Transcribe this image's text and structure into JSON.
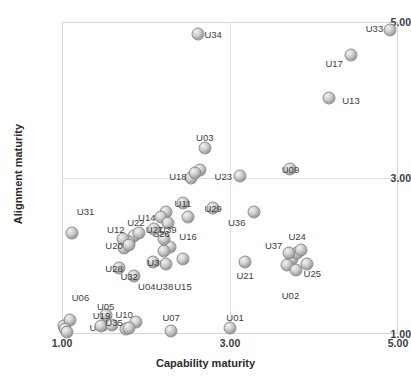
{
  "chart_data": {
    "type": "scatter",
    "title": "",
    "xlabel": "Capability maturity",
    "ylabel": "Alignment maturity",
    "xlim": [
      1.0,
      5.0
    ],
    "ylim": [
      1.0,
      5.0
    ],
    "xticks": [
      "1.00",
      "3.00",
      "5.00"
    ],
    "xtick_values": [
      1.0,
      3.0,
      5.0
    ],
    "yticks": [
      "1.00",
      "3.00",
      "5.00"
    ],
    "ytick_values": [
      1.0,
      3.0,
      5.0
    ],
    "grid": true,
    "legend": "none",
    "marker_style": "3d-gray-sphere",
    "points": [
      {
        "label": "U01",
        "x": 3.0,
        "y": 1.08,
        "lx": 3.06,
        "ly": 1.22
      },
      {
        "label": "U02",
        "x": 3.78,
        "y": 1.82,
        "lx": 3.72,
        "ly": 1.5
      },
      {
        "label": "U03",
        "x": 2.7,
        "y": 3.38,
        "lx": 2.7,
        "ly": 3.52
      },
      {
        "label": "U04",
        "x": 2.08,
        "y": 1.92,
        "lx": 2.01,
        "ly": 1.62
      },
      {
        "label": "U05",
        "x": 1.52,
        "y": 1.24,
        "lx": 1.52,
        "ly": 1.36
      },
      {
        "label": "U06",
        "x": 1.03,
        "y": 1.06,
        "lx": 1.22,
        "ly": 1.48
      },
      {
        "label": "U07",
        "x": 2.3,
        "y": 1.04,
        "lx": 2.3,
        "ly": 1.22
      },
      {
        "label": "U08",
        "x": 1.06,
        "y": 1.02,
        "lx": 1.43,
        "ly": 1.09
      },
      {
        "label": "U09",
        "x": 3.72,
        "y": 3.12,
        "lx": 3.72,
        "ly": 3.12
      },
      {
        "label": "U10",
        "x": 1.8,
        "y": 1.08,
        "lx": 1.74,
        "ly": 1.26
      },
      {
        "label": "U11",
        "x": 2.44,
        "y": 2.68,
        "lx": 2.44,
        "ly": 2.68
      },
      {
        "label": "U12",
        "x": 1.73,
        "y": 2.22,
        "lx": 1.64,
        "ly": 2.34
      },
      {
        "label": "U13",
        "x": 4.18,
        "y": 4.02,
        "lx": 4.44,
        "ly": 4.0
      },
      {
        "label": "U14",
        "x": 2.18,
        "y": 2.5,
        "lx": 2.01,
        "ly": 2.5
      },
      {
        "label": "U15",
        "x": 2.44,
        "y": 1.96,
        "lx": 2.44,
        "ly": 1.62
      },
      {
        "label": "U16",
        "x": 2.5,
        "y": 2.5,
        "lx": 2.5,
        "ly": 2.26
      },
      {
        "label": "U17",
        "x": 4.44,
        "y": 4.58,
        "lx": 4.24,
        "ly": 4.48
      },
      {
        "label": "U18",
        "x": 2.58,
        "y": 3.06,
        "lx": 2.38,
        "ly": 3.02
      },
      {
        "label": "U19",
        "x": 1.47,
        "y": 1.1,
        "lx": 1.47,
        "ly": 1.24
      },
      {
        "label": "U20",
        "x": 1.8,
        "y": 2.14,
        "lx": 1.62,
        "ly": 2.14
      },
      {
        "label": "U21",
        "x": 3.18,
        "y": 1.92,
        "lx": 3.18,
        "ly": 1.76
      },
      {
        "label": "U22",
        "x": 1.92,
        "y": 2.3,
        "lx": 1.88,
        "ly": 2.44
      },
      {
        "label": "U23",
        "x": 3.12,
        "y": 3.02,
        "lx": 2.92,
        "ly": 3.02
      },
      {
        "label": "U24",
        "x": 3.84,
        "y": 2.08,
        "lx": 3.8,
        "ly": 2.26
      },
      {
        "label": "U25",
        "x": 3.92,
        "y": 1.9,
        "lx": 3.98,
        "ly": 1.78
      },
      {
        "label": "U26",
        "x": 2.22,
        "y": 2.22,
        "lx": 2.18,
        "ly": 2.3
      },
      {
        "label": "U27",
        "x": 2.1,
        "y": 2.34,
        "lx": 2.1,
        "ly": 2.34
      },
      {
        "label": "U28",
        "x": 1.68,
        "y": 1.84,
        "lx": 1.62,
        "ly": 1.84
      },
      {
        "label": "U29",
        "x": 2.8,
        "y": 2.62,
        "lx": 2.8,
        "ly": 2.62
      },
      {
        "label": "U30",
        "x": 2.22,
        "y": 2.06,
        "lx": 2.12,
        "ly": 1.92
      },
      {
        "label": "U31",
        "x": 1.12,
        "y": 2.3,
        "lx": 1.28,
        "ly": 2.58
      },
      {
        "label": "U32",
        "x": 1.86,
        "y": 1.74,
        "lx": 1.8,
        "ly": 1.74
      },
      {
        "label": "U33",
        "x": 4.9,
        "y": 4.9,
        "lx": 4.72,
        "ly": 4.92
      },
      {
        "label": "U34",
        "x": 2.62,
        "y": 4.84,
        "lx": 2.8,
        "ly": 4.84
      },
      {
        "label": "U35",
        "x": 1.6,
        "y": 1.12,
        "lx": 1.62,
        "ly": 1.16
      },
      {
        "label": "U36",
        "x": 3.28,
        "y": 2.56,
        "lx": 3.08,
        "ly": 2.44
      },
      {
        "label": "U37",
        "x": 3.7,
        "y": 2.04,
        "lx": 3.52,
        "ly": 2.14
      },
      {
        "label": "U38",
        "x": 2.24,
        "y": 1.9,
        "lx": 2.22,
        "ly": 1.62
      },
      {
        "label": "U39",
        "x": 2.26,
        "y": 2.42,
        "lx": 2.26,
        "ly": 2.34
      }
    ],
    "extra_markers": [
      {
        "x": 1.02,
        "y": 1.1
      },
      {
        "x": 1.1,
        "y": 1.18
      },
      {
        "x": 1.76,
        "y": 1.06
      },
      {
        "x": 1.88,
        "y": 1.16
      },
      {
        "x": 2.24,
        "y": 2.56
      },
      {
        "x": 1.86,
        "y": 2.26
      },
      {
        "x": 1.8,
        "y": 2.18
      },
      {
        "x": 1.74,
        "y": 2.1
      },
      {
        "x": 2.64,
        "y": 3.1
      },
      {
        "x": 2.54,
        "y": 3.0
      },
      {
        "x": 2.28,
        "y": 2.12
      },
      {
        "x": 3.74,
        "y": 1.96
      },
      {
        "x": 3.8,
        "y": 2.04
      },
      {
        "x": 3.68,
        "y": 1.88
      }
    ]
  }
}
